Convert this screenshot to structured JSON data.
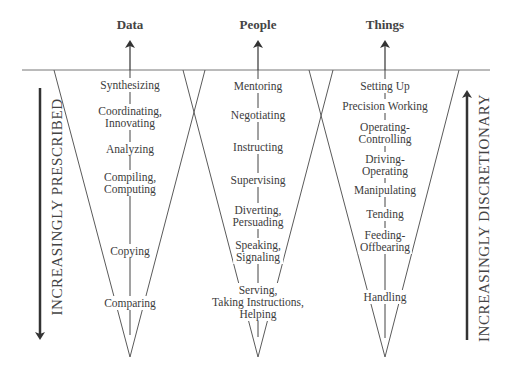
{
  "columns": [
    {
      "title": "Data",
      "x": 130,
      "functions": [
        {
          "lines": [
            "Synthesizing"
          ],
          "y": 85
        },
        {
          "lines": [
            "Coordinating,",
            "Innovating"
          ],
          "y": 117
        },
        {
          "lines": [
            "Analyzing"
          ],
          "y": 149
        },
        {
          "lines": [
            "Compiling,",
            "Computing"
          ],
          "y": 183
        },
        {
          "lines": [
            "Copying"
          ],
          "y": 251
        },
        {
          "lines": [
            "Comparing"
          ],
          "y": 303
        }
      ]
    },
    {
      "title": "People",
      "x": 258,
      "functions": [
        {
          "lines": [
            "Mentoring"
          ],
          "y": 86
        },
        {
          "lines": [
            "Negotiating"
          ],
          "y": 115
        },
        {
          "lines": [
            "Instructing"
          ],
          "y": 147
        },
        {
          "lines": [
            "Supervising"
          ],
          "y": 180
        },
        {
          "lines": [
            "Diverting,",
            "Persuading"
          ],
          "y": 216
        },
        {
          "lines": [
            "Speaking,",
            "Signaling"
          ],
          "y": 251
        },
        {
          "lines": [
            "Serving,",
            "Taking Instructions,",
            "Helping"
          ],
          "y": 302
        }
      ]
    },
    {
      "title": "Things",
      "x": 385,
      "functions": [
        {
          "lines": [
            "Setting Up"
          ],
          "y": 86
        },
        {
          "lines": [
            "Precision Working"
          ],
          "y": 106
        },
        {
          "lines": [
            "Operating-",
            "Controlling"
          ],
          "y": 133
        },
        {
          "lines": [
            "Driving-",
            "Operating"
          ],
          "y": 165
        },
        {
          "lines": [
            "Manipulating"
          ],
          "y": 190
        },
        {
          "lines": [
            "Tending"
          ],
          "y": 214
        },
        {
          "lines": [
            "Feeding-",
            "Offbearing"
          ],
          "y": 241
        },
        {
          "lines": [
            "Handling"
          ],
          "y": 297
        }
      ]
    }
  ],
  "left_axis": {
    "label": "INCREASINGLY PRESCRIBED",
    "direction": "down"
  },
  "right_axis": {
    "label": "INCREASINGLY DISCRETIONARY",
    "direction": "up"
  },
  "colors": {
    "line": "#5a5a5a",
    "arrow": "#333333",
    "text": "#3c3c3c"
  }
}
